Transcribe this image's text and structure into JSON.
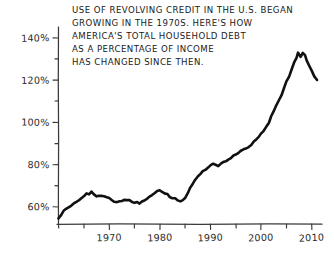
{
  "figure": {
    "background_color": "#ffffff",
    "ink_color": "#111111",
    "annotation_lines": [
      "USE OF REVOLVING CREDIT IN THE U.S. BEGAN",
      "GROWING IN THE 1970S. HERE'S HOW",
      "AMERICA'S TOTAL HOUSEHOLD DEBT",
      "AS A PERCENTAGE OF INCOME",
      "HAS CHANGED SINCE THEN."
    ]
  },
  "chart_data": {
    "type": "line",
    "title": "USE OF REVOLVING CREDIT IN THE U.S. BEGAN GROWING IN THE 1970S. HERE'S HOW AMERICA'S TOTAL HOUSEHOLD DEBT AS A PERCENTAGE OF INCOME HAS CHANGED SINCE THEN.",
    "xlabel": "",
    "ylabel": "",
    "xlim": [
      1960,
      2012
    ],
    "ylim": [
      52,
      145
    ],
    "grid": false,
    "legend": false,
    "style": "hand-drawn",
    "xticks": [
      1960,
      1965,
      1970,
      1975,
      1980,
      1985,
      1990,
      1995,
      2000,
      2005,
      2010
    ],
    "xtick_labels": [
      "",
      "",
      "1970",
      "",
      "1980",
      "",
      "1990",
      "",
      "2000",
      "",
      "2010"
    ],
    "yticks": [
      60,
      70,
      80,
      90,
      100,
      110,
      120,
      130,
      140
    ],
    "ytick_labels": [
      "60%",
      "",
      "80%",
      "",
      "100%",
      "",
      "120%",
      "",
      "140%"
    ],
    "series": [
      {
        "name": "U.S. household debt as a percentage of income",
        "x": [
          1960.0,
          1960.5,
          1961.0,
          1961.5,
          1962.0,
          1962.5,
          1963.0,
          1963.5,
          1964.0,
          1964.5,
          1965.0,
          1965.5,
          1966.0,
          1966.5,
          1967.0,
          1967.5,
          1968.0,
          1968.5,
          1969.0,
          1969.5,
          1970.0,
          1970.5,
          1971.0,
          1971.5,
          1972.0,
          1972.5,
          1973.0,
          1973.5,
          1974.0,
          1974.5,
          1975.0,
          1975.5,
          1976.0,
          1976.5,
          1977.0,
          1977.5,
          1978.0,
          1978.5,
          1979.0,
          1979.5,
          1980.0,
          1980.5,
          1981.0,
          1981.5,
          1982.0,
          1982.5,
          1983.0,
          1983.5,
          1984.0,
          1984.5,
          1985.0,
          1985.5,
          1986.0,
          1986.5,
          1987.0,
          1987.5,
          1988.0,
          1988.5,
          1989.0,
          1989.5,
          1990.0,
          1990.5,
          1991.0,
          1991.5,
          1992.0,
          1992.5,
          1993.0,
          1993.5,
          1994.0,
          1994.5,
          1995.0,
          1995.5,
          1996.0,
          1996.5,
          1997.0,
          1997.5,
          1998.0,
          1998.5,
          1999.0,
          1999.5,
          2000.0,
          2000.5,
          2001.0,
          2001.5,
          2002.0,
          2002.5,
          2003.0,
          2003.5,
          2004.0,
          2004.5,
          2005.0,
          2005.5,
          2006.0,
          2006.5,
          2007.0,
          2007.3,
          2007.8,
          2008.2,
          2008.6,
          2009.0,
          2009.5,
          2010.0,
          2010.5,
          2011.0
        ],
        "y": [
          54.5,
          56.5,
          58.0,
          59.0,
          59.8,
          60.6,
          61.5,
          62.4,
          63.3,
          64.2,
          65.2,
          66.4,
          65.8,
          67.2,
          65.9,
          65.3,
          65.6,
          65.2,
          64.8,
          64.4,
          64.0,
          63.4,
          62.8,
          62.6,
          63.0,
          62.7,
          63.2,
          62.9,
          63.1,
          62.4,
          61.8,
          62.2,
          61.9,
          62.6,
          63.4,
          64.3,
          65.2,
          66.0,
          66.8,
          67.4,
          68.0,
          67.3,
          66.5,
          65.8,
          65.0,
          64.3,
          63.8,
          63.4,
          63.0,
          63.2,
          64.4,
          66.6,
          69.0,
          71.2,
          73.0,
          74.4,
          75.6,
          76.8,
          78.0,
          78.9,
          79.6,
          80.2,
          80.0,
          79.6,
          80.2,
          81.0,
          81.6,
          82.4,
          83.0,
          84.0,
          84.8,
          85.6,
          86.4,
          87.2,
          87.8,
          88.6,
          89.4,
          90.6,
          92.0,
          93.4,
          94.4,
          95.6,
          97.4,
          100.0,
          102.6,
          105.4,
          108.0,
          110.6,
          113.0,
          116.0,
          119.0,
          122.0,
          125.0,
          128.0,
          130.5,
          132.6,
          131.0,
          132.8,
          131.4,
          129.0,
          126.5,
          124.0,
          122.0,
          120.2
        ]
      }
    ],
    "peak": {
      "x": 2007.8,
      "y": 132.8,
      "label": ""
    },
    "start": {
      "x": 1960,
      "y": 54.5
    },
    "end": {
      "x": 2011,
      "y": 120.2
    }
  }
}
